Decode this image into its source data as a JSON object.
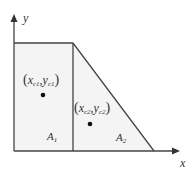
{
  "diagram": {
    "axes": {
      "x_label": "x",
      "y_label": "y"
    },
    "regions": [
      {
        "name": "A1",
        "label_main": "A",
        "label_sub": "1",
        "shape": "rectangle",
        "centroid_label": {
          "open": "(",
          "x_main": "x",
          "x_sub": "c1",
          "comma": ",",
          "y_main": "y",
          "y_sub": "c1",
          "close": ")"
        }
      },
      {
        "name": "A2",
        "label_main": "A",
        "label_sub": "2",
        "shape": "triangle",
        "centroid_label": {
          "open": "(",
          "x_main": "x",
          "x_sub": "c2",
          "comma": ",",
          "y_main": "y",
          "y_sub": "c2",
          "close": ")"
        }
      }
    ],
    "colors": {
      "fill": "#f4f4f4",
      "stroke": "#444444",
      "dot": "#111111",
      "background": "#ffffff"
    }
  }
}
